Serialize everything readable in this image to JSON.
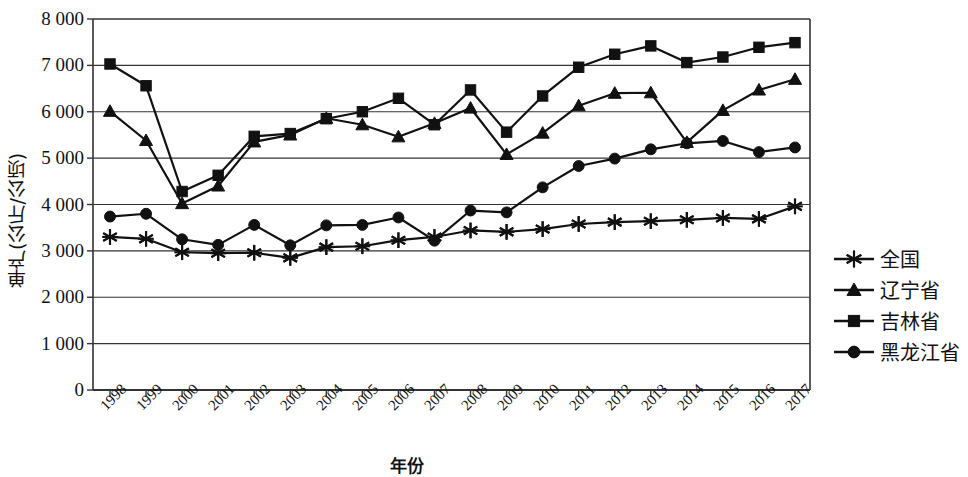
{
  "chart_data": {
    "type": "line",
    "title": "",
    "xlabel": "年份",
    "ylabel": "单产(公斤/公顷)",
    "ylim": [
      0,
      8000
    ],
    "ytick_step": 1000,
    "grid": true,
    "legend_position": "right",
    "x": [
      "1998",
      "1999",
      "2000",
      "2001",
      "2002",
      "2003",
      "2004",
      "2005",
      "2006",
      "2007",
      "2008",
      "2009",
      "2010",
      "2011",
      "2012",
      "2013",
      "2014",
      "2015",
      "2016",
      "2017"
    ],
    "ytick_labels": [
      "8 000",
      "7 000",
      "6 000",
      "5 000",
      "4 000",
      "3 000",
      "2 000",
      "1 000",
      "0"
    ],
    "ytick_values": [
      8000,
      7000,
      6000,
      5000,
      4000,
      3000,
      2000,
      1000,
      0
    ],
    "series": [
      {
        "name": "全国",
        "marker": "star",
        "values": [
          3300,
          3260,
          2970,
          2950,
          2960,
          2850,
          3080,
          3100,
          3230,
          3300,
          3440,
          3410,
          3470,
          3580,
          3620,
          3640,
          3670,
          3710,
          3690,
          3960
        ]
      },
      {
        "name": "辽宁省",
        "marker": "triangle",
        "values": [
          6010,
          5380,
          4020,
          4400,
          5350,
          5500,
          5860,
          5720,
          5460,
          5750,
          6080,
          5080,
          5540,
          6130,
          6400,
          6410,
          5340,
          6030,
          6470,
          6700
        ]
      },
      {
        "name": "吉林省",
        "marker": "square",
        "values": [
          7030,
          6560,
          4280,
          4630,
          5470,
          5530,
          5850,
          6000,
          6290,
          5720,
          6470,
          5560,
          6340,
          6960,
          7240,
          7420,
          7060,
          7180,
          7390,
          7490
        ]
      },
      {
        "name": "黑龙江省",
        "marker": "circle",
        "values": [
          3740,
          3800,
          3250,
          3130,
          3560,
          3120,
          3550,
          3560,
          3720,
          3220,
          3870,
          3830,
          4370,
          4830,
          4990,
          5190,
          5320,
          5370,
          5130,
          5230
        ]
      }
    ]
  },
  "legend": {
    "items": [
      {
        "label": "全国",
        "marker": "star"
      },
      {
        "label": "辽宁省",
        "marker": "triangle"
      },
      {
        "label": "吉林省",
        "marker": "square"
      },
      {
        "label": "黑龙江省",
        "marker": "circle"
      }
    ]
  },
  "colors": {
    "ink": "#111111",
    "grid": "#333333",
    "background": "#ffffff"
  }
}
